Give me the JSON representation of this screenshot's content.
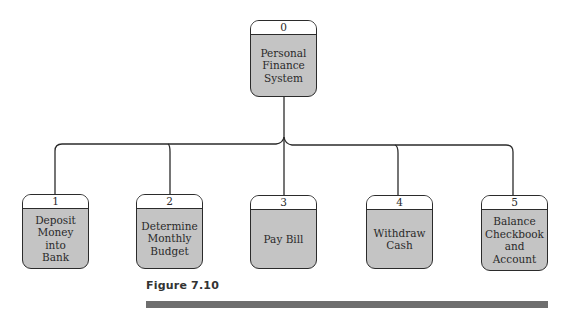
{
  "diagram": {
    "root": {
      "id": "0",
      "label": "Personal Finance System"
    },
    "children": [
      {
        "id": "1",
        "label": "Deposit Money into Bank"
      },
      {
        "id": "2",
        "label": "Determine Monthly Budget"
      },
      {
        "id": "3",
        "label": "Pay Bill"
      },
      {
        "id": "4",
        "label": "Withdraw Cash"
      },
      {
        "id": "5",
        "label": "Balance Checkbook and Account"
      }
    ]
  },
  "caption": "Figure 7.10",
  "colors": {
    "box_fill": "#c4c4c4",
    "header_fill": "#ffffff",
    "line": "#2b2b2b",
    "rule": "#6e6e6e"
  }
}
